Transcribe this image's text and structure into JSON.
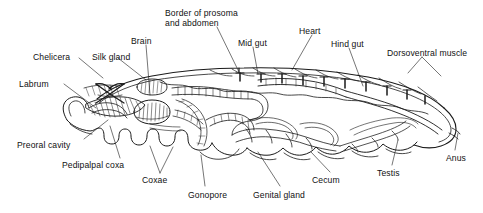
{
  "figure": {
    "ink_color": "#1a1a1a",
    "background_color": "#ffffff"
  },
  "labels": [
    {
      "id": "border-of-prosoma-and-abdomen",
      "line1": "Border of prosoma",
      "line2": "and abdomen",
      "x": 165,
      "y": 8
    },
    {
      "id": "mid-gut",
      "text": "Mid gut",
      "x": 238,
      "y": 38
    },
    {
      "id": "heart",
      "text": "Heart",
      "x": 299,
      "y": 26
    },
    {
      "id": "hind-gut",
      "text": "Hind gut",
      "x": 331,
      "y": 39
    },
    {
      "id": "dorsoventral-muscle",
      "text": "Dorsoventral muscle",
      "x": 387,
      "y": 48
    },
    {
      "id": "brain",
      "text": "Brain",
      "x": 131,
      "y": 36
    },
    {
      "id": "chelicera",
      "text": "Chelicera",
      "x": 33,
      "y": 52
    },
    {
      "id": "silk-gland",
      "text": "Silk gland",
      "x": 92,
      "y": 52
    },
    {
      "id": "labrum",
      "text": "Labrum",
      "x": 19,
      "y": 79
    },
    {
      "id": "preoral-cavity",
      "text": "Preoral cavity",
      "x": 17,
      "y": 140
    },
    {
      "id": "pedipalpal-coxa",
      "text": "Pedipalpal coxa",
      "x": 62,
      "y": 160
    },
    {
      "id": "coxae",
      "text": "Coxae",
      "x": 142,
      "y": 175
    },
    {
      "id": "gonopore",
      "text": "Gonopore",
      "x": 188,
      "y": 190
    },
    {
      "id": "genital-gland",
      "text": "Genital gland",
      "x": 253,
      "y": 190
    },
    {
      "id": "cecum",
      "text": "Cecum",
      "x": 312,
      "y": 175
    },
    {
      "id": "testis",
      "text": "Testis",
      "x": 377,
      "y": 168
    },
    {
      "id": "anus",
      "text": "Anus",
      "x": 446,
      "y": 153
    }
  ]
}
